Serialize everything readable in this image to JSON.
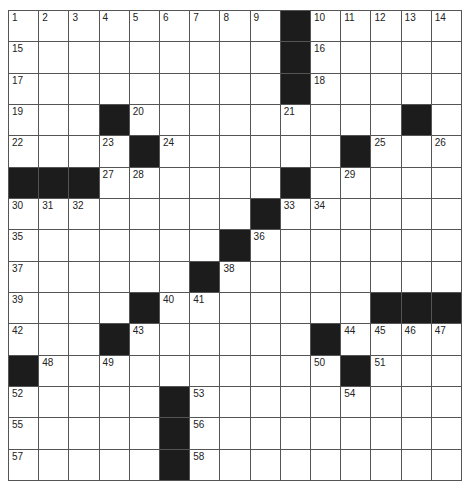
{
  "puzzle": {
    "size": {
      "rows": 15,
      "cols": 15
    },
    "colors": {
      "block": "#1c1c1c",
      "cell": "#ffffff",
      "line": "#555555",
      "number": "#222222"
    },
    "layout": [
      ".........#.....",
      ".........#.....",
      ".........#.....",
      "...#.........#.",
      "....#......#...",
      "###......#.....",
      "........#......",
      ".......#.......",
      "......#........",
      "....#.......###",
      "...#......#....",
      "#..........#...",
      ".....#.........",
      ".....#.........",
      ".....#........."
    ],
    "numbers": [
      {
        "r": 0,
        "c": 0,
        "n": "1"
      },
      {
        "r": 0,
        "c": 1,
        "n": "2"
      },
      {
        "r": 0,
        "c": 2,
        "n": "3"
      },
      {
        "r": 0,
        "c": 3,
        "n": "4"
      },
      {
        "r": 0,
        "c": 4,
        "n": "5"
      },
      {
        "r": 0,
        "c": 5,
        "n": "6"
      },
      {
        "r": 0,
        "c": 6,
        "n": "7"
      },
      {
        "r": 0,
        "c": 7,
        "n": "8"
      },
      {
        "r": 0,
        "c": 8,
        "n": "9"
      },
      {
        "r": 0,
        "c": 10,
        "n": "10"
      },
      {
        "r": 0,
        "c": 11,
        "n": "11"
      },
      {
        "r": 0,
        "c": 12,
        "n": "12"
      },
      {
        "r": 0,
        "c": 13,
        "n": "13"
      },
      {
        "r": 0,
        "c": 14,
        "n": "14"
      },
      {
        "r": 1,
        "c": 0,
        "n": "15"
      },
      {
        "r": 1,
        "c": 10,
        "n": "16"
      },
      {
        "r": 2,
        "c": 0,
        "n": "17"
      },
      {
        "r": 2,
        "c": 10,
        "n": "18"
      },
      {
        "r": 3,
        "c": 0,
        "n": "19"
      },
      {
        "r": 3,
        "c": 4,
        "n": "20"
      },
      {
        "r": 3,
        "c": 9,
        "n": "21"
      },
      {
        "r": 4,
        "c": 0,
        "n": "22"
      },
      {
        "r": 4,
        "c": 3,
        "n": "23"
      },
      {
        "r": 4,
        "c": 5,
        "n": "24"
      },
      {
        "r": 4,
        "c": 12,
        "n": "25"
      },
      {
        "r": 4,
        "c": 14,
        "n": "26"
      },
      {
        "r": 5,
        "c": 3,
        "n": "27"
      },
      {
        "r": 5,
        "c": 4,
        "n": "28"
      },
      {
        "r": 5,
        "c": 11,
        "n": "29"
      },
      {
        "r": 6,
        "c": 0,
        "n": "30"
      },
      {
        "r": 6,
        "c": 1,
        "n": "31"
      },
      {
        "r": 6,
        "c": 2,
        "n": "32"
      },
      {
        "r": 6,
        "c": 9,
        "n": "33"
      },
      {
        "r": 6,
        "c": 10,
        "n": "34"
      },
      {
        "r": 7,
        "c": 0,
        "n": "35"
      },
      {
        "r": 7,
        "c": 8,
        "n": "36"
      },
      {
        "r": 8,
        "c": 0,
        "n": "37"
      },
      {
        "r": 8,
        "c": 7,
        "n": "38"
      },
      {
        "r": 9,
        "c": 0,
        "n": "39"
      },
      {
        "r": 9,
        "c": 5,
        "n": "40"
      },
      {
        "r": 9,
        "c": 6,
        "n": "41"
      },
      {
        "r": 10,
        "c": 0,
        "n": "42"
      },
      {
        "r": 10,
        "c": 4,
        "n": "43"
      },
      {
        "r": 10,
        "c": 11,
        "n": "44"
      },
      {
        "r": 10,
        "c": 12,
        "n": "45"
      },
      {
        "r": 10,
        "c": 13,
        "n": "46"
      },
      {
        "r": 10,
        "c": 14,
        "n": "47"
      },
      {
        "r": 11,
        "c": 1,
        "n": "48"
      },
      {
        "r": 11,
        "c": 3,
        "n": "49"
      },
      {
        "r": 11,
        "c": 10,
        "n": "50"
      },
      {
        "r": 11,
        "c": 12,
        "n": "51"
      },
      {
        "r": 12,
        "c": 0,
        "n": "52"
      },
      {
        "r": 12,
        "c": 6,
        "n": "53"
      },
      {
        "r": 12,
        "c": 11,
        "n": "54"
      },
      {
        "r": 13,
        "c": 0,
        "n": "55"
      },
      {
        "r": 13,
        "c": 6,
        "n": "56"
      },
      {
        "r": 14,
        "c": 0,
        "n": "57"
      },
      {
        "r": 14,
        "c": 6,
        "n": "58"
      }
    ]
  }
}
